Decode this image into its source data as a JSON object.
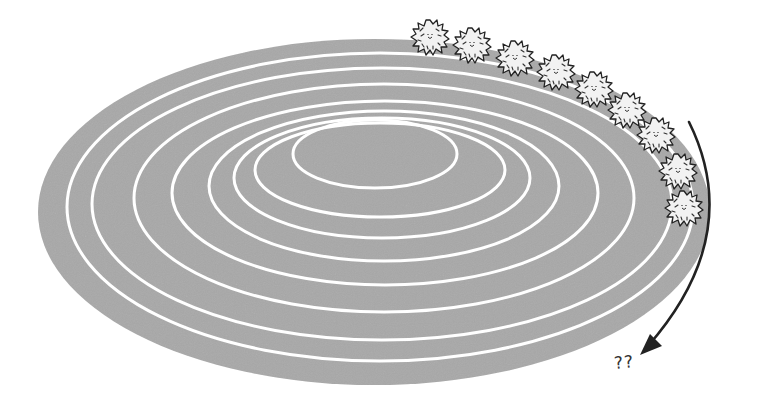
{
  "figure": {
    "track": {
      "fill_color": "#a8a8a8",
      "lane_line_color": "#ffffff",
      "outer": {
        "cx": 374,
        "cy": 212,
        "rx": 336,
        "ry": 173
      },
      "lanes": [
        {
          "cx": 380,
          "cy": 207,
          "rx": 313,
          "ry": 154
        },
        {
          "cx": 382,
          "cy": 204,
          "rx": 290,
          "ry": 136
        },
        {
          "cx": 384,
          "cy": 198,
          "rx": 250,
          "ry": 114
        },
        {
          "cx": 385,
          "cy": 193,
          "rx": 213,
          "ry": 92
        },
        {
          "cx": 384,
          "cy": 186,
          "rx": 175,
          "ry": 75
        },
        {
          "cx": 382,
          "cy": 178,
          "rx": 148,
          "ry": 60
        },
        {
          "cx": 380,
          "cy": 170,
          "rx": 125,
          "ry": 47
        },
        {
          "cx": 375,
          "cy": 154,
          "rx": 82,
          "ry": 34
        }
      ]
    },
    "creatures": {
      "count": 9,
      "icon": "spiky-ball-creature",
      "positions": [
        {
          "x": 430,
          "y": 37
        },
        {
          "x": 472,
          "y": 45
        },
        {
          "x": 515,
          "y": 58
        },
        {
          "x": 556,
          "y": 72
        },
        {
          "x": 594,
          "y": 89
        },
        {
          "x": 627,
          "y": 110
        },
        {
          "x": 656,
          "y": 135
        },
        {
          "x": 678,
          "y": 171
        },
        {
          "x": 684,
          "y": 208
        }
      ]
    },
    "arrow": {
      "icon": "curved-arrow",
      "color": "#222222",
      "path": "M 689 122 Q 745 235 648 346"
    },
    "question_label": "??"
  }
}
